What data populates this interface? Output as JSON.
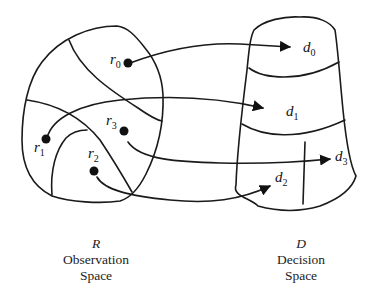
{
  "diagram": {
    "observation_space": {
      "symbol": "R",
      "title_line1": "Observation",
      "title_line2": "Space",
      "points": [
        {
          "base": "r",
          "sub": "0"
        },
        {
          "base": "r",
          "sub": "1"
        },
        {
          "base": "r",
          "sub": "2"
        },
        {
          "base": "r",
          "sub": "3"
        }
      ]
    },
    "decision_space": {
      "symbol": "D",
      "title_line1": "Decision",
      "title_line2": "Space",
      "regions": [
        {
          "base": "d",
          "sub": "0"
        },
        {
          "base": "d",
          "sub": "1"
        },
        {
          "base": "d",
          "sub": "2"
        },
        {
          "base": "d",
          "sub": "3"
        }
      ]
    },
    "mappings": [
      {
        "from": "r0",
        "to": "d0"
      },
      {
        "from": "r1",
        "to": "d1"
      },
      {
        "from": "r2",
        "to": "d2"
      },
      {
        "from": "r3",
        "to": "d3"
      }
    ],
    "colors": {
      "ink": "#1a1a1a",
      "background": "#ffffff"
    }
  }
}
